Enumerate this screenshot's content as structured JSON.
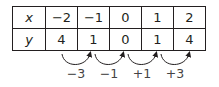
{
  "table": {
    "rows": [
      {
        "header": "x",
        "values": [
          "−2",
          "−1",
          "0",
          "1",
          "2"
        ]
      },
      {
        "header": "y",
        "values": [
          "4",
          "1",
          "0",
          "1",
          "4"
        ]
      }
    ]
  },
  "differences": {
    "labels": [
      "−3",
      "−1",
      "+1",
      "+3"
    ]
  }
}
